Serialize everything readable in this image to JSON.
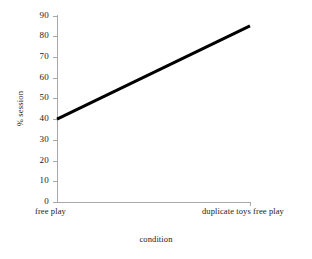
{
  "chart_data": {
    "type": "line",
    "title": "",
    "xlabel": "condition",
    "ylabel": "% session",
    "categories": [
      "free play",
      "duplicate toys free play"
    ],
    "x": [
      0,
      1
    ],
    "values": [
      40,
      85
    ],
    "series": [
      {
        "name": "% session",
        "values": [
          40,
          85
        ],
        "color": "#000000"
      }
    ],
    "ylim": [
      0,
      90
    ],
    "ytick_values": [
      0,
      10,
      20,
      30,
      40,
      50,
      60,
      70,
      80,
      90
    ],
    "ytick_labels": [
      "0",
      "10",
      "20",
      "30",
      "40",
      "50",
      "60",
      "70",
      "80",
      "90"
    ],
    "xtick_labels": [
      "free play",
      "duplicate toys free play"
    ],
    "grid": false,
    "legend": false,
    "legend_position": "none",
    "axis_color": "#a8a8a8",
    "line_color": "#000000",
    "background_color": "#ffffff"
  }
}
